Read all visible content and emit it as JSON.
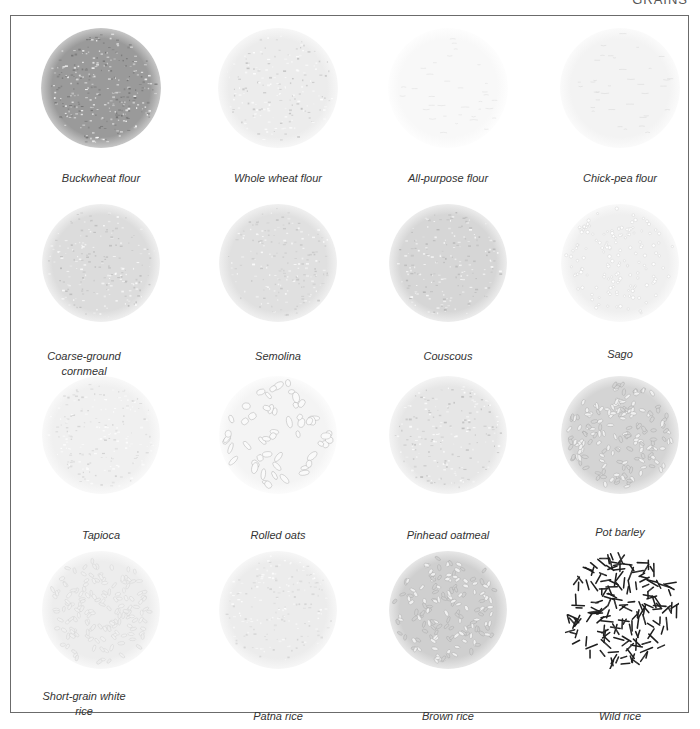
{
  "header": {
    "section_label": "GRAINS"
  },
  "grid": {
    "columns": 4,
    "rows": 4,
    "items": [
      {
        "label": "Buckwheat flour",
        "tone": "#9a9a9a",
        "edge": "#c4c4c4",
        "texture": "fine-dark",
        "grain_color": "#6e6e6e"
      },
      {
        "label": "Whole wheat flour",
        "tone": "#ececec",
        "edge": "#f6f6f6",
        "texture": "fine",
        "grain_color": "#bdbdbd"
      },
      {
        "label": "All-purpose flour",
        "tone": "#f8f8f8",
        "edge": "#fdfdfd",
        "texture": "powder",
        "grain_color": "#d6d6d6"
      },
      {
        "label": "Chick-pea flour",
        "tone": "#f3f3f3",
        "edge": "#fafafa",
        "texture": "powder",
        "grain_color": "#cfcfcf"
      },
      {
        "label": "Coarse-ground cornmeal",
        "tone": "#dcdcdc",
        "edge": "#eeeeee",
        "texture": "fine",
        "grain_color": "#b5b5b5"
      },
      {
        "label": "Semolina",
        "tone": "#e0e0e0",
        "edge": "#efefef",
        "texture": "fine",
        "grain_color": "#c2c2c2"
      },
      {
        "label": "Couscous",
        "tone": "#d6d6d6",
        "edge": "#ebebeb",
        "texture": "fine",
        "grain_color": "#b0b0b0"
      },
      {
        "label": "Sago",
        "tone": "#efefef",
        "edge": "#f8f8f8",
        "texture": "beads",
        "grain_color": "#c8c8c8"
      },
      {
        "label": "Tapioca",
        "tone": "#f0f0f0",
        "edge": "#f8f8f8",
        "texture": "fine",
        "grain_color": "#cdcdcd"
      },
      {
        "label": "Rolled oats",
        "tone": "#f4f4f4",
        "edge": "#fbfbfb",
        "texture": "flakes",
        "grain_color": "#a8a8a8"
      },
      {
        "label": "Pinhead oatmeal",
        "tone": "#e6e6e6",
        "edge": "#f3f3f3",
        "texture": "fine",
        "grain_color": "#b8b8b8"
      },
      {
        "label": "Pot barley",
        "tone": "#d4d4d4",
        "edge": "#e9e9e9",
        "texture": "grains",
        "grain_color": "#9c9c9c"
      },
      {
        "label": "Short-grain white rice",
        "tone": "#ededed",
        "edge": "#f7f7f7",
        "texture": "grains",
        "grain_color": "#cccccc"
      },
      {
        "label": "Patna rice",
        "tone": "#ececec",
        "edge": "#f6f6f6",
        "texture": "fine",
        "grain_color": "#d0d0d0"
      },
      {
        "label": "Brown rice",
        "tone": "#cfcfcf",
        "edge": "#e6e6e6",
        "texture": "grains",
        "grain_color": "#a0a0a0"
      },
      {
        "label": "Wild rice",
        "tone": "#ffffff",
        "edge": "#ffffff",
        "texture": "sticks",
        "grain_color": "#1e1e1e"
      }
    ]
  }
}
